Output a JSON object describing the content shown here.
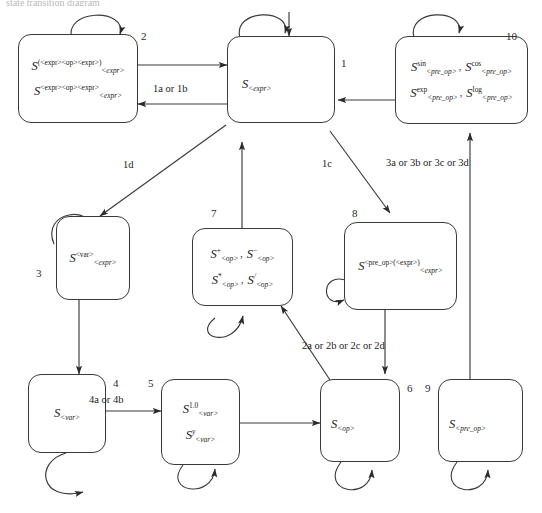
{
  "page": {
    "top_cropped_text": "state transition diagram",
    "width": 542,
    "height": 513,
    "stroke_color": "#3a3a3a",
    "text_color": "#1a1a1a"
  },
  "diagram": {
    "type": "state-transition-diagram",
    "states": [
      {
        "id": "1",
        "number": "1",
        "name": "state-1-expr",
        "lines": [
          {
            "cells": [
              {
                "base": "S",
                "sup": "",
                "sub": "<expr>"
              }
            ]
          }
        ]
      },
      {
        "id": "2",
        "number": "2",
        "name": "state-2-paren-expr",
        "lines": [
          {
            "cells": [
              {
                "base": "S",
                "sup": "(<expr><op><expr>)",
                "sub": "<expr>"
              }
            ]
          },
          {
            "cells": [
              {
                "base": "S",
                "sup": "<expr><op><expr>",
                "sub": "<expr>"
              }
            ]
          }
        ]
      },
      {
        "id": "3",
        "number": "3",
        "name": "state-3-var-expr",
        "lines": [
          {
            "cells": [
              {
                "base": "S",
                "sup": "<var>",
                "sub": "<expr>"
              }
            ]
          }
        ]
      },
      {
        "id": "4",
        "number": "4",
        "name": "state-4-var",
        "lines": [
          {
            "cells": [
              {
                "base": "S",
                "sup": "",
                "sub": "<var>"
              }
            ]
          }
        ]
      },
      {
        "id": "5",
        "number": "5",
        "name": "state-5-var-values",
        "lines": [
          {
            "cells": [
              {
                "base": "S",
                "sup": "1.0",
                "sub": "<var>"
              }
            ]
          },
          {
            "cells": [
              {
                "base": "S",
                "sup": "y",
                "sub": "<var>",
                "sup_italic": true
              }
            ]
          }
        ]
      },
      {
        "id": "6",
        "number": "6",
        "name": "state-6-op",
        "lines": [
          {
            "cells": [
              {
                "base": "S",
                "sup": "",
                "sub": "<op>"
              }
            ]
          }
        ]
      },
      {
        "id": "7",
        "number": "7",
        "name": "state-7-operators",
        "lines": [
          {
            "cells": [
              {
                "base": "S",
                "sup": "+",
                "sub": "<op>"
              },
              {
                "base": "S",
                "sup": "−",
                "sub": "<op>"
              }
            ]
          },
          {
            "cells": [
              {
                "base": "S",
                "sup": "*",
                "sub": "<op>"
              },
              {
                "base": "S",
                "sup": "/",
                "sub": "<op>",
                "sup_italic": true
              }
            ]
          }
        ]
      },
      {
        "id": "8",
        "number": "8",
        "name": "state-8-preop-expr",
        "lines": [
          {
            "cells": [
              {
                "base": "S",
                "sup": "<pre_op>(<expr>)",
                "sub": "<expr>"
              }
            ]
          }
        ]
      },
      {
        "id": "9",
        "number": "9",
        "name": "state-9-preop",
        "lines": [
          {
            "cells": [
              {
                "base": "S",
                "sup": "",
                "sub": "<pre_op>"
              }
            ]
          }
        ]
      },
      {
        "id": "10",
        "number": "10",
        "name": "state-10-preop-functions",
        "lines": [
          {
            "cells": [
              {
                "base": "S",
                "sup": "sin",
                "sub": "<pre_op>"
              },
              {
                "base": "S",
                "sup": "cos",
                "sub": "<pre_op>"
              }
            ]
          },
          {
            "cells": [
              {
                "base": "S",
                "sup": "exp",
                "sub": "<pre_op>"
              },
              {
                "base": "S",
                "sup": "log",
                "sub": "<pre_op>"
              }
            ]
          }
        ]
      }
    ],
    "edge_labels": [
      {
        "id": "e-1a1b",
        "text": "1a or 1b"
      },
      {
        "id": "e-1c",
        "text": "1c"
      },
      {
        "id": "e-1d",
        "text": "1d"
      },
      {
        "id": "e-3abcd",
        "text": "3a or 3b or 3c or 3d"
      },
      {
        "id": "e-2abcd",
        "text": "2a or 2b or 2c or 2d"
      },
      {
        "id": "e-4a4b",
        "text": "4a or 4b"
      }
    ],
    "separators": {
      "comma": ","
    }
  }
}
